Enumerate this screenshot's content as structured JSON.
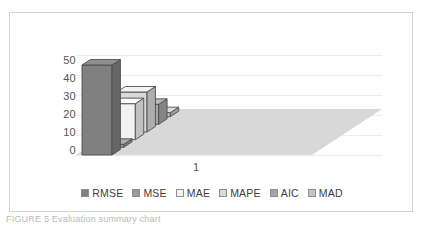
{
  "figure": {
    "caption_fragment": "FIGURE 5 Evaluation summary chart"
  },
  "chart": {
    "x_category_label": "1",
    "y_ticks": [
      "50",
      "40",
      "30",
      "20",
      "10",
      "0"
    ]
  },
  "legend": {
    "items": [
      {
        "label": "RMSE",
        "color": "#808080"
      },
      {
        "label": "MSE",
        "color": "#9a9a9a"
      },
      {
        "label": "MAE",
        "color": "#f2f2f2"
      },
      {
        "label": "MAPE",
        "color": "#d9d9d9"
      },
      {
        "label": "AIC",
        "color": "#a6a6a6"
      },
      {
        "label": "MAD",
        "color": "#c4c4c4"
      }
    ]
  },
  "chart_data": {
    "type": "bar",
    "title": "",
    "subtitle": "",
    "xlabel": "",
    "ylabel": "",
    "categories": [
      "1"
    ],
    "series": [
      {
        "name": "RMSE",
        "values": [
          45
        ],
        "color": "#808080"
      },
      {
        "name": "MSE",
        "values": [
          1.5
        ],
        "color": "#9a9a9a"
      },
      {
        "name": "MAE",
        "values": [
          18
        ],
        "color": "#f2f2f2"
      },
      {
        "name": "MAPE",
        "values": [
          20
        ],
        "color": "#d9d9d9"
      },
      {
        "name": "AIC",
        "values": [
          10
        ],
        "color": "#a6a6a6"
      },
      {
        "name": "MAD",
        "values": [
          2
        ],
        "color": "#c4c4c4"
      }
    ],
    "ylim": [
      0,
      50
    ],
    "ytick_step": 10,
    "grid": true,
    "legend_position": "bottom",
    "three_d": true
  }
}
